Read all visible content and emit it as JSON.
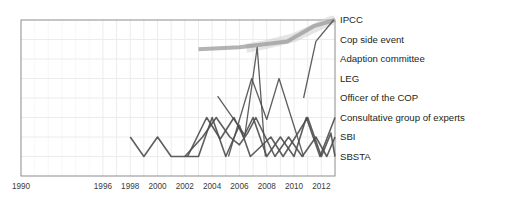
{
  "chart_data": {
    "type": "line",
    "title": "",
    "xlabel": "",
    "ylabel": "",
    "xlim": [
      1990,
      2013
    ],
    "ylim": [
      0,
      8
    ],
    "grid": true,
    "legend_position": "right-inline-labels",
    "x_tick_labels": [
      "1990",
      "1996",
      "1998",
      "2000",
      "2002",
      "2004",
      "2006",
      "2008",
      "2010",
      "2012"
    ],
    "x_tick_values": [
      1990,
      1996,
      1998,
      2000,
      2002,
      2004,
      2006,
      2008,
      2010,
      2012
    ],
    "y_category_labels": [
      "IPCC",
      "Cop side event",
      "Adaption committee",
      "LEG",
      "Officer of the COP",
      "Consultative group of experts",
      "SBI",
      "SBSTA"
    ],
    "y_category_values": [
      8,
      7,
      6,
      5,
      4,
      3,
      2,
      1
    ],
    "series": [
      {
        "name": "IPCC",
        "color": "#cfcfcf",
        "opacity": 0.55,
        "width": 9,
        "points": [
          {
            "x": 2006.5,
            "y": 6.55
          },
          {
            "x": 2008.0,
            "y": 6.75
          },
          {
            "x": 2010.0,
            "y": 7.1
          },
          {
            "x": 2011.4,
            "y": 7.55
          },
          {
            "x": 2012.6,
            "y": 7.95
          },
          {
            "x": 2013.0,
            "y": 8.0
          }
        ]
      },
      {
        "name": "Cop side event",
        "color": "#9a9a9a",
        "opacity": 0.75,
        "width": 4,
        "points": [
          {
            "x": 2003.0,
            "y": 6.5
          },
          {
            "x": 2006.0,
            "y": 6.6
          },
          {
            "x": 2009.5,
            "y": 6.9
          },
          {
            "x": 2011.5,
            "y": 7.7
          },
          {
            "x": 2013.0,
            "y": 8.0
          }
        ]
      },
      {
        "name": "Adaption committee",
        "color": "#4d4d4d",
        "opacity": 0.9,
        "width": 1.3,
        "points": [
          {
            "x": 2010.7,
            "y": 4.0
          },
          {
            "x": 2011.6,
            "y": 6.9
          },
          {
            "x": 2012.9,
            "y": 8.0
          }
        ]
      },
      {
        "name": "LEG",
        "color": "#4d4d4d",
        "opacity": 0.9,
        "width": 1.3,
        "points": [
          {
            "x": 2005.2,
            "y": 1.0
          },
          {
            "x": 2006.9,
            "y": 5.0
          },
          {
            "x": 2008.0,
            "y": 2.9
          },
          {
            "x": 2008.9,
            "y": 5.0
          },
          {
            "x": 2010.7,
            "y": 1.0
          }
        ]
      },
      {
        "name": "Officer of the COP",
        "color": "#4d4d4d",
        "opacity": 0.9,
        "width": 1.3,
        "points": [
          {
            "x": 2004.4,
            "y": 4.1
          },
          {
            "x": 2006.4,
            "y": 2.1
          },
          {
            "x": 2007.3,
            "y": 6.6
          },
          {
            "x": 2007.9,
            "y": 1.0
          }
        ]
      },
      {
        "name": "Consultative group of experts",
        "color": "#4d4d4d",
        "opacity": 0.9,
        "width": 1.6,
        "points": [
          {
            "x": 2002.2,
            "y": 1.0
          },
          {
            "x": 2003.6,
            "y": 3.0
          },
          {
            "x": 2004.6,
            "y": 1.9
          },
          {
            "x": 2005.6,
            "y": 3.0
          },
          {
            "x": 2006.3,
            "y": 2.0
          },
          {
            "x": 2007.0,
            "y": 3.0
          },
          {
            "x": 2008.0,
            "y": 1.0
          },
          {
            "x": 2009.0,
            "y": 2.0
          },
          {
            "x": 2010.0,
            "y": 1.0
          },
          {
            "x": 2010.9,
            "y": 3.0
          },
          {
            "x": 2011.9,
            "y": 1.0
          },
          {
            "x": 2013.0,
            "y": 3.0
          }
        ]
      },
      {
        "name": "SBI",
        "color": "#4d4d4d",
        "opacity": 0.9,
        "width": 1.6,
        "points": [
          {
            "x": 2002.0,
            "y": 1.0
          },
          {
            "x": 2003.3,
            "y": 2.0
          },
          {
            "x": 2004.3,
            "y": 3.0
          },
          {
            "x": 2005.3,
            "y": 2.0
          },
          {
            "x": 2006.0,
            "y": 1.6
          },
          {
            "x": 2006.6,
            "y": 2.2
          },
          {
            "x": 2007.2,
            "y": 3.0
          },
          {
            "x": 2008.6,
            "y": 1.0
          },
          {
            "x": 2009.6,
            "y": 2.0
          },
          {
            "x": 2010.6,
            "y": 1.0
          },
          {
            "x": 2011.6,
            "y": 2.0
          },
          {
            "x": 2012.4,
            "y": 1.0
          },
          {
            "x": 2013.0,
            "y": 2.0
          }
        ]
      },
      {
        "name": "SBSTA",
        "color": "#4d4d4d",
        "opacity": 0.9,
        "width": 1.6,
        "points": [
          {
            "x": 1998.0,
            "y": 2.0
          },
          {
            "x": 1999.0,
            "y": 1.0
          },
          {
            "x": 2000.0,
            "y": 2.0
          },
          {
            "x": 2001.0,
            "y": 1.0
          },
          {
            "x": 2003.0,
            "y": 1.0
          },
          {
            "x": 2004.0,
            "y": 3.0
          },
          {
            "x": 2005.0,
            "y": 1.0
          },
          {
            "x": 2006.0,
            "y": 2.6
          },
          {
            "x": 2006.8,
            "y": 1.0
          },
          {
            "x": 2008.3,
            "y": 2.0
          },
          {
            "x": 2009.2,
            "y": 1.0
          },
          {
            "x": 2011.0,
            "y": 3.0
          },
          {
            "x": 2012.0,
            "y": 1.0
          },
          {
            "x": 2012.7,
            "y": 2.2
          },
          {
            "x": 2013.0,
            "y": 1.0
          }
        ]
      }
    ]
  },
  "axis": {
    "frame_color": "#8c8c8c",
    "grid_color": "#ececec"
  }
}
